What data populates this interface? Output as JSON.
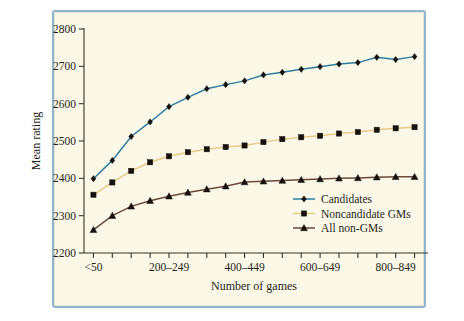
{
  "figure": {
    "background_color": "#fcf8e8",
    "border_color": "#8fb6cf"
  },
  "chart_data": {
    "type": "line",
    "title": "",
    "xlabel": "Number of games",
    "ylabel": "Mean rating",
    "ylim": [
      2200,
      2800
    ],
    "ytick_values": [
      2200,
      2300,
      2400,
      2500,
      2600,
      2700,
      2800
    ],
    "ytick_labels": [
      "2200",
      "2300",
      "2400",
      "2500",
      "2600",
      "2700",
      "2800"
    ],
    "grid": false,
    "legend_position": "lower right",
    "categories": [
      "<50",
      "50-99",
      "100-149",
      "150-199",
      "200-249",
      "250-299",
      "300-349",
      "350-399",
      "400-449",
      "450-499",
      "500-549",
      "550-599",
      "600-649",
      "650-699",
      "700-749",
      "750-799",
      "800-849",
      "850-899"
    ],
    "xtick_labeled": {
      "0": "<50",
      "4": "200–249",
      "8": "400–449",
      "12": "600–649",
      "16": "800–849"
    },
    "series": [
      {
        "name": "Candidates",
        "color": "#2e7f9e",
        "marker": "diamond",
        "marker_color": "#15110c",
        "values": [
          2399,
          2448,
          2512,
          2551,
          2592,
          2617,
          2640,
          2651,
          2661,
          2677,
          2684,
          2692,
          2699,
          2706,
          2710,
          2724,
          2718,
          2726
        ]
      },
      {
        "name": "Noncandidate GMs",
        "color": "#e8c98a",
        "marker": "square",
        "marker_color": "#15110c",
        "values": [
          2356,
          2389,
          2420,
          2443,
          2459,
          2470,
          2478,
          2484,
          2488,
          2497,
          2505,
          2510,
          2514,
          2520,
          2524,
          2530,
          2534,
          2537
        ]
      },
      {
        "name": "All non-GMs",
        "color": "#6b4a3c",
        "marker": "triangle",
        "marker_color": "#15110c",
        "values": [
          2262,
          2300,
          2325,
          2340,
          2352,
          2362,
          2371,
          2379,
          2390,
          2392,
          2394,
          2396,
          2398,
          2400,
          2401,
          2403,
          2404,
          2404
        ]
      }
    ]
  }
}
